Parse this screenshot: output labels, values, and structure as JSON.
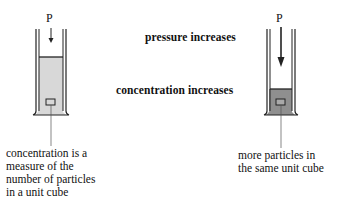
{
  "diagram": {
    "arrows": [
      {
        "label": "pressure increases",
        "style": "stippled-band"
      },
      {
        "label": "concentration increases",
        "style": "stippled-band"
      }
    ],
    "left_cylinder": {
      "pressure_label": "P",
      "gas_fill": "#d8d8d8",
      "arrow_length": "short",
      "caption": [
        "concentration is a",
        "measure of the",
        "number of particles",
        "in a unit cube"
      ]
    },
    "right_cylinder": {
      "pressure_label": "P",
      "gas_fill": "#8f8f8f",
      "arrow_length": "long",
      "caption": [
        "more particles in",
        "the same unit cube"
      ]
    }
  }
}
